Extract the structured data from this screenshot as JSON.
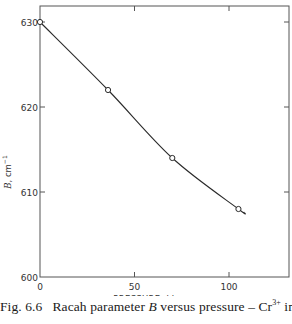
{
  "chart_data": {
    "type": "line",
    "title": "",
    "xlabel": "PRESSURE, kbar",
    "ylabel": "B, cm⁻¹",
    "xlim": [
      0,
      132
    ],
    "ylim": [
      600,
      632
    ],
    "x_ticks": [
      0,
      50,
      100
    ],
    "x_tick_labels": [
      "0",
      "50",
      "100"
    ],
    "y_ticks": [
      600,
      610,
      620,
      630
    ],
    "y_tick_labels": [
      "600",
      "610",
      "620",
      "630"
    ],
    "grid": false,
    "legend": null,
    "series": [
      {
        "name": "Racah parameter B",
        "marker": "open-circle",
        "x": [
          0,
          36,
          70,
          105
        ],
        "y": [
          630,
          622,
          614,
          608
        ]
      }
    ],
    "curve_end": {
      "x": 108,
      "y": 607.6
    }
  },
  "caption": {
    "fig_label": "Fig. 6.6",
    "text_before_B": "Racah parameter ",
    "B": "B",
    "text_after_B": " versus pressure – Cr",
    "superscript": "3+",
    "text_end": " in"
  }
}
